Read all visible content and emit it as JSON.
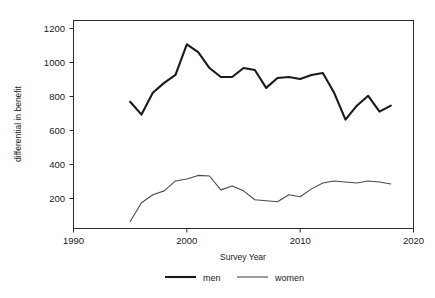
{
  "chart_data": {
    "type": "line",
    "title": "",
    "xlabel": "Survey Year",
    "ylabel": "differential in benefit",
    "xlim": [
      1990,
      2020
    ],
    "ylim": [
      200,
      1250
    ],
    "xticks": [
      1990,
      2000,
      2010,
      2020
    ],
    "yticks": [
      200,
      400,
      600,
      800,
      1000,
      1200
    ],
    "grid": false,
    "legend_position": "bottom-center",
    "x": [
      1995,
      1996,
      1997,
      1998,
      1999,
      2000,
      2001,
      2002,
      2003,
      2004,
      2005,
      2006,
      2007,
      2008,
      2009,
      2010,
      2011,
      2012,
      2013,
      2014,
      2015,
      2016,
      2017,
      2018
    ],
    "series": [
      {
        "name": "men",
        "values": [
          840,
          775,
          885,
          935,
          975,
          1130,
          1090,
          1010,
          965,
          965,
          1010,
          1000,
          910,
          960,
          965,
          955,
          975,
          985,
          885,
          750,
          820,
          870,
          790,
          820
        ]
      },
      {
        "name": "women",
        "values": [
          235,
          330,
          370,
          390,
          440,
          450,
          468,
          465,
          395,
          415,
          390,
          345,
          340,
          335,
          370,
          360,
          400,
          430,
          440,
          435,
          430,
          440,
          435,
          425
        ]
      }
    ]
  },
  "axes": {
    "y_label": "differential in benefit",
    "x_label": "Survey Year",
    "y_tick_labels": [
      "1200",
      "1000",
      "800",
      "600",
      "400",
      "200"
    ],
    "x_tick_labels": [
      "1990",
      "2000",
      "2010",
      "2020"
    ]
  },
  "legend": {
    "items": [
      {
        "label": "men",
        "style": "thick-line",
        "color": "#1a1a1a"
      },
      {
        "label": "women",
        "style": "thin-line",
        "color": "#4a4a4a"
      }
    ]
  },
  "colors": {
    "background": "#ffffff",
    "frame": "#2b2b2b",
    "men": "#1a1a1a",
    "women": "#4a4a4a",
    "text": "#1a1a1a"
  }
}
